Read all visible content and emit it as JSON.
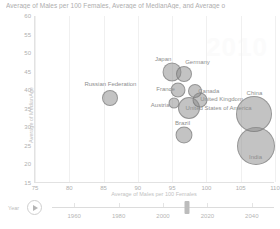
{
  "chart_data": {
    "type": "scatter",
    "title": "Average of Males per 100 Females, Average of MedianAge, and Average o",
    "xlabel": "Average of Males per 100 Females",
    "ylabel": "Average of MedianAge",
    "xlim": [
      75,
      110
    ],
    "ylim": [
      15,
      60
    ],
    "xticks": [
      75,
      80,
      85,
      90,
      95,
      100,
      105,
      110
    ],
    "yticks": [
      60,
      55,
      50,
      45,
      40,
      35,
      30,
      25,
      20,
      15
    ],
    "grid": "vertical",
    "legend": "none",
    "bubble_color": "#8c8c8c",
    "watermark": "2010",
    "points": [
      {
        "label": "Russian Federation",
        "x": 86.0,
        "y": 38.0,
        "size": 16,
        "label_dx": 0,
        "label_dy": -14
      },
      {
        "label": "Japan",
        "x": 95.0,
        "y": 44.8,
        "size": 19,
        "label_dx": -9,
        "label_dy": -13
      },
      {
        "label": "Germany",
        "x": 96.8,
        "y": 44.3,
        "size": 16,
        "label_dx": 13,
        "label_dy": -12
      },
      {
        "label": "France",
        "x": 95.8,
        "y": 40.0,
        "size": 15,
        "label_dx": -12,
        "label_dy": -1
      },
      {
        "label": "Canada",
        "x": 98.3,
        "y": 39.8,
        "size": 14,
        "label_dx": 14,
        "label_dy": 0
      },
      {
        "label": "Austria",
        "x": 95.3,
        "y": 36.5,
        "size": 11,
        "label_dx": -14,
        "label_dy": 2
      },
      {
        "label": "United Kingdom",
        "x": 99.0,
        "y": 37.5,
        "size": 15,
        "label_dx": 22,
        "label_dy": -1
      },
      {
        "label": "United States of America",
        "x": 97.4,
        "y": 35.2,
        "size": 22,
        "label_dx": 30,
        "label_dy": 0
      },
      {
        "label": "Brazil",
        "x": 96.8,
        "y": 28.0,
        "size": 17,
        "label_dx": -2,
        "label_dy": -12
      },
      {
        "label": "China",
        "x": 107.0,
        "y": 33.5,
        "size": 36,
        "label_dx": 0,
        "label_dy": -21
      },
      {
        "label": "India",
        "x": 107.3,
        "y": 25.0,
        "size": 38,
        "label_dx": -1,
        "label_dy": 11
      }
    ]
  },
  "timeline": {
    "label": "Year",
    "play_icon": "play-icon",
    "ticks": [
      1960,
      1980,
      2000,
      2020,
      2040
    ],
    "min": 1950,
    "max": 2050,
    "value": 2011
  }
}
